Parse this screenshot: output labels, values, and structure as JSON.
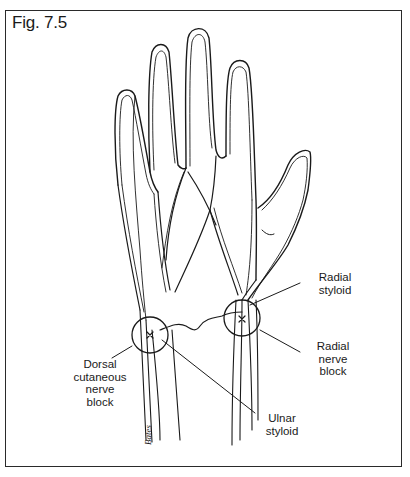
{
  "figure": {
    "title": "Fig. 7.5",
    "line_color": "#1a1a1a",
    "frame_color": "#2a2a2a"
  },
  "labels": {
    "radial_styloid": {
      "line1": "Radial",
      "line2": "styloid"
    },
    "radial_nerve_block": {
      "line1": "Radial",
      "line2": "nerve",
      "line3": "block"
    },
    "dorsal_cutaneous_nerve_block": {
      "line1": "Dorsal",
      "line2": "cutaneous",
      "line3": "nerve",
      "line4": "block"
    },
    "ulnar_styloid": {
      "line1": "Ulnar",
      "line2": "styloid"
    }
  },
  "markers": {
    "injection_site_ulnar": {
      "cx": 150,
      "cy": 335,
      "r": 18
    },
    "injection_site_radial": {
      "cx": 242,
      "cy": 318,
      "r": 18
    }
  },
  "signature": "Bates"
}
